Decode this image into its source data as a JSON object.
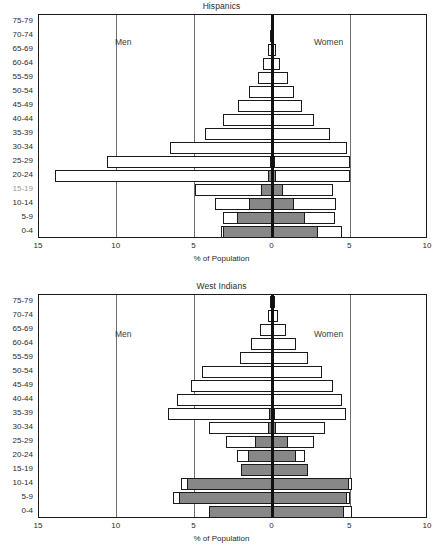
{
  "figure": {
    "width": 443,
    "height": 559,
    "background": "#ffffff",
    "bar_outline_color": "#1a1a1a",
    "bar_fill_open": "#ffffff",
    "bar_fill_shaded": "#878787",
    "gridline_color": "#6e6e6e",
    "zeroline_color": "#111111"
  },
  "axis": {
    "xlabel": "% of Population",
    "tick_labels": [
      "15",
      "10",
      "5",
      "0",
      "5",
      "10"
    ],
    "tick_values": [
      -15,
      -10,
      -5,
      0,
      5,
      10
    ],
    "xmin": -15,
    "xmax": 10,
    "left_label": "Men",
    "right_label": "Women",
    "age_groups": [
      "75-79",
      "70-74",
      "65-69",
      "60-64",
      "55-59",
      "50-54",
      "45-49",
      "40-44",
      "35-39",
      "30-34",
      "25-29",
      "20-24",
      "15-19",
      "10-14",
      "5-9",
      "0-4"
    ]
  },
  "chart_data": [
    {
      "type": "bar",
      "subtype": "population-pyramid",
      "title": "Hispanics",
      "xlabel": "% of Population",
      "ylabel": "",
      "xlim": [
        -15,
        10
      ],
      "grid": true,
      "legend_position": "none",
      "categories": [
        "75-79",
        "70-74",
        "65-69",
        "60-64",
        "55-59",
        "50-54",
        "45-49",
        "40-44",
        "35-39",
        "30-34",
        "25-29",
        "20-24",
        "15-19",
        "10-14",
        "5-9",
        "0-4"
      ],
      "series": [
        {
          "name": "Men",
          "side": "left",
          "values": [
            0.1,
            0.15,
            0.3,
            0.6,
            0.9,
            1.5,
            2.2,
            3.2,
            4.3,
            6.6,
            10.6,
            14.0,
            5.0,
            3.7,
            3.2,
            3.3
          ]
        },
        {
          "name": "Women",
          "side": "right",
          "values": [
            0.1,
            0.1,
            0.2,
            0.5,
            1.0,
            1.4,
            1.9,
            2.7,
            3.7,
            4.8,
            5.0,
            5.0,
            3.9,
            4.1,
            4.0,
            4.5
          ]
        },
        {
          "name": "Men (shaded, US-born)",
          "side": "left",
          "shaded": true,
          "values": [
            0,
            0,
            0,
            0,
            0,
            0,
            0,
            0,
            0,
            0,
            0.15,
            0.3,
            0.75,
            1.5,
            2.3,
            3.2
          ]
        },
        {
          "name": "Women (shaded, US-born)",
          "side": "right",
          "shaded": true,
          "values": [
            0,
            0,
            0.12,
            0,
            0,
            0,
            0,
            0,
            0,
            0,
            0.15,
            0.25,
            0.65,
            1.4,
            2.1,
            2.9
          ]
        }
      ]
    },
    {
      "type": "bar",
      "subtype": "population-pyramid",
      "title": "West Indians",
      "xlabel": "% of Population",
      "ylabel": "",
      "xlim": [
        -15,
        10
      ],
      "grid": true,
      "legend_position": "none",
      "categories": [
        "75-79",
        "70-74",
        "65-69",
        "60-64",
        "55-59",
        "50-54",
        "45-49",
        "40-44",
        "35-39",
        "30-34",
        "25-29",
        "20-24",
        "15-19",
        "10-14",
        "5-9",
        "0-4"
      ],
      "series": [
        {
          "name": "Men",
          "side": "left",
          "values": [
            0.15,
            0.3,
            0.8,
            1.4,
            2.1,
            4.5,
            5.2,
            6.1,
            6.7,
            4.1,
            3.0,
            2.3,
            2.0,
            5.9,
            6.4,
            4.1
          ]
        },
        {
          "name": "Women",
          "side": "right",
          "values": [
            0.15,
            0.35,
            0.9,
            1.5,
            2.3,
            3.2,
            3.9,
            4.5,
            4.7,
            3.4,
            2.7,
            2.1,
            2.3,
            5.1,
            5.0,
            5.1
          ]
        },
        {
          "name": "Men (shaded, US-born)",
          "side": "left",
          "shaded": true,
          "values": [
            0,
            0,
            0,
            0,
            0,
            0,
            0,
            0,
            0.25,
            0.3,
            1.1,
            1.6,
            2.0,
            5.5,
            6.0,
            4.1
          ]
        },
        {
          "name": "Women (shaded, US-born)",
          "side": "right",
          "shaded": true,
          "values": [
            0,
            0,
            0,
            0,
            0,
            0,
            0,
            0,
            0.15,
            0.2,
            1.0,
            1.5,
            2.3,
            4.9,
            4.8,
            4.6
          ]
        }
      ]
    }
  ]
}
